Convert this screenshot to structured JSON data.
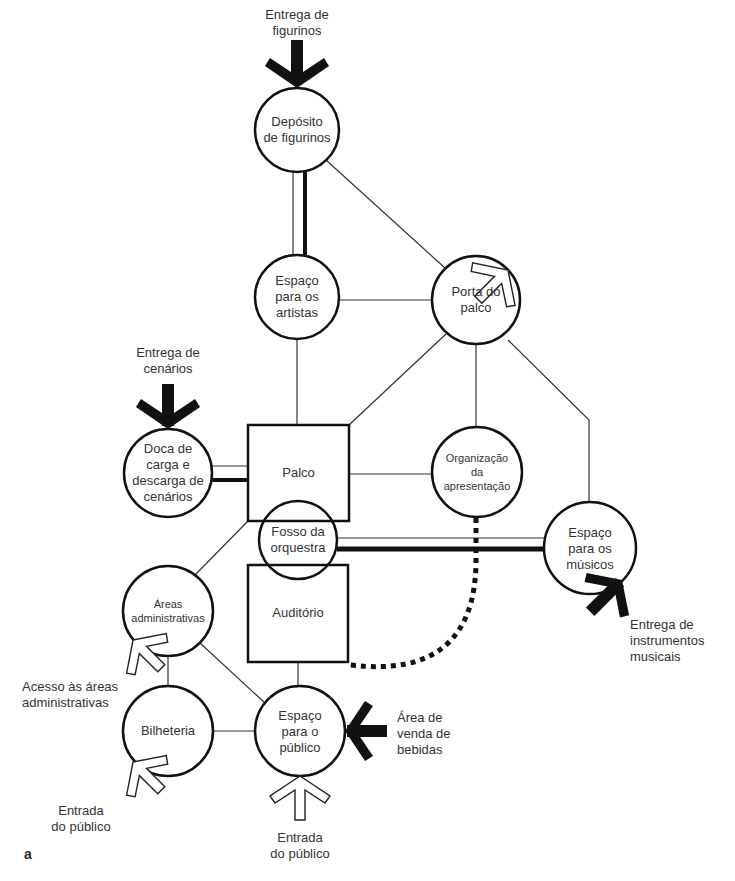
{
  "figure_label": "a",
  "nodes": {
    "deposito": {
      "label": "Depósito\nde figurinos",
      "shape": "circle"
    },
    "artistas": {
      "label": "Espaço\npara os\nartistas",
      "shape": "circle"
    },
    "porta": {
      "label": "Porta do\npalco",
      "shape": "circle"
    },
    "doca": {
      "label": "Doca de\ncarga e\ndescarga de\ncenários",
      "shape": "circle"
    },
    "palco": {
      "label": "Palco",
      "shape": "rect"
    },
    "organizacao": {
      "label": "Organização\nda\napresentação",
      "shape": "circle"
    },
    "fosso": {
      "label": "Fosso da\norquestra",
      "shape": "circle"
    },
    "auditorio": {
      "label": "Auditório",
      "shape": "rect"
    },
    "musicos": {
      "label": "Espaço\npara os\nmúsicos",
      "shape": "circle"
    },
    "admin": {
      "label": "Áreas\nadministrativas",
      "shape": "circle"
    },
    "bilheteria": {
      "label": "Bilheteria",
      "shape": "circle"
    },
    "publico": {
      "label": "Espaço\npara o\npúblico",
      "shape": "circle"
    }
  },
  "annotations": {
    "entrega_figurinos": "Entrega de\nfigurinos",
    "entrega_cenarios": "Entrega de\ncenários",
    "entrega_instrumentos": "Entrega de\ninstrumentos\nmusicais",
    "acesso_admin": "Acesso às áreas\nadministrativas",
    "entrada_publico_left": "Entrada\ndo público",
    "entrada_publico_bottom": "Entrada\ndo público",
    "venda_bebidas": "Área de\nvenda de\nbebidas"
  },
  "legend_semantics": {
    "thick_black_arrow": "service delivery",
    "hollow_arrow": "people access",
    "thin_line": "adjacency",
    "double_line": "strong link (people + goods)",
    "dotted_line": "visual/control link"
  }
}
